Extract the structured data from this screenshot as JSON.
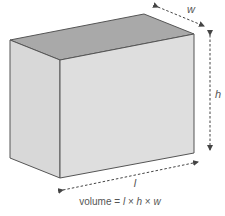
{
  "diagram": {
    "type": "cuboid",
    "colors": {
      "top_face": "#a8a8a8",
      "front_face": "#dcdcdc",
      "side_face": "#d6d6d6",
      "edge": "#555555",
      "arrow": "#444444",
      "text": "#555555"
    },
    "labels": {
      "width": "w",
      "height": "h",
      "length": "l"
    },
    "formula": {
      "prefix": "volume = ",
      "l": "l",
      "times1": " × ",
      "h": "h",
      "times2": " × ",
      "w": "w"
    }
  }
}
